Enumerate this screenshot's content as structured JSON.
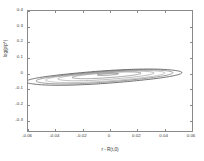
{
  "figure": {
    "background_color": "#ffffff",
    "frame_color": "#8a8a8a"
  },
  "axes": {
    "x": {
      "label": "r - R(t,0)",
      "ticks": [
        "-0.06",
        "-0.04",
        "-0.02",
        "0",
        "0.02",
        "0.04",
        "0.06"
      ],
      "tick_values": [
        -0.06,
        -0.04,
        -0.02,
        0,
        0.02,
        0.04,
        0.06
      ],
      "limits": [
        -0.06,
        0.06
      ]
    },
    "y": {
      "label": "log(p/p*)",
      "ticks": [
        "0.4",
        "0.3",
        "0.2",
        "0.1",
        "0",
        "-0.1",
        "-0.2",
        "-0.3"
      ],
      "tick_values": [
        0.4,
        0.3,
        0.2,
        0.1,
        0,
        -0.1,
        -0.2,
        -0.3
      ],
      "limits": [
        -0.38,
        0.4
      ]
    }
  },
  "chart_data": {
    "type": "line",
    "title": "",
    "subtitle": "",
    "xlabel": "r - R(t,0)",
    "ylabel": "log(p/p*)",
    "xlim": [
      -0.06,
      0.06
    ],
    "ylim": [
      -0.38,
      0.4
    ],
    "xticks": [
      -0.06,
      -0.04,
      -0.02,
      0,
      0.02,
      0.04,
      0.06
    ],
    "yticks": [
      -0.3,
      -0.2,
      -0.1,
      0,
      0.1,
      0.2,
      0.3,
      0.4
    ],
    "grid": false,
    "legend": null,
    "series": [
      {
        "name": "orbit-1-innermost",
        "color": "#555555",
        "closed": true,
        "center": [
          -0.0015,
          -0.012
        ],
        "semi_major": 0.009,
        "semi_minor": 0.0042,
        "rotation_deg": 38,
        "line_width": 0.6
      },
      {
        "name": "orbit-2",
        "color": "#6b6b6b",
        "closed": true,
        "center": [
          -0.0025,
          -0.018
        ],
        "semi_major": 0.03,
        "semi_minor": 0.013,
        "rotation_deg": 39,
        "line_width": 0.6
      },
      {
        "name": "orbit-3",
        "color": "#8c8c8c",
        "closed": true,
        "center": [
          -0.003,
          -0.022
        ],
        "semi_major": 0.042,
        "semi_minor": 0.019,
        "rotation_deg": 40,
        "line_width": 0.6
      },
      {
        "name": "orbit-4",
        "color": "#9a9a9a",
        "closed": true,
        "center": [
          -0.0035,
          -0.026
        ],
        "semi_major": 0.052,
        "semi_minor": 0.024,
        "rotation_deg": 40,
        "line_width": 0.6
      },
      {
        "name": "orbit-5",
        "color": "#707070",
        "closed": true,
        "center": [
          -0.004,
          -0.028
        ],
        "semi_major": 0.06,
        "semi_minor": 0.028,
        "rotation_deg": 41,
        "line_width": 0.7
      },
      {
        "name": "orbit-6-outermost",
        "color": "#4a4a4a",
        "closed": true,
        "center": [
          -0.0045,
          -0.03
        ],
        "semi_major": 0.068,
        "semi_minor": 0.033,
        "rotation_deg": 41,
        "line_width": 0.8
      }
    ]
  }
}
